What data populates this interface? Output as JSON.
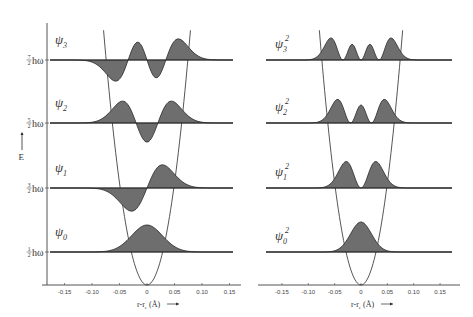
{
  "figure": {
    "left_panel": {
      "title": "Harmonic oscillator wavefunctions",
      "y_axis_label": "E",
      "energy_levels": [
        {
          "n": 0,
          "label": "½ hω",
          "num": "1",
          "den": "2",
          "wf_label": "ψ0"
        },
        {
          "n": 1,
          "label": "3/2 hω",
          "num": "3",
          "den": "2",
          "wf_label": "ψ1"
        },
        {
          "n": 2,
          "label": "5/2 hω",
          "num": "5",
          "den": "2",
          "wf_label": "ψ2"
        },
        {
          "n": 3,
          "label": "7/2 hω",
          "num": "7",
          "den": "2",
          "wf_label": "ψ3"
        }
      ],
      "x_axis_label": "r-re (Å) →",
      "x_ticks": [
        "-0.15",
        "-0.10",
        "-0.05",
        "0",
        "0.05",
        "0.10",
        "0.15"
      ]
    },
    "right_panel": {
      "title": "Probability densities",
      "levels": [
        {
          "n": 0,
          "wf_label": "ψ0",
          "sup": "2"
        },
        {
          "n": 1,
          "wf_label": "ψ1",
          "sup": "2"
        },
        {
          "n": 2,
          "wf_label": "ψ2",
          "sup": "2"
        },
        {
          "n": 3,
          "wf_label": "ψ3",
          "sup": "2"
        }
      ],
      "x_axis_label": "r-re (Å) →",
      "x_ticks": [
        "-0.15",
        "-0.10",
        "-0.05",
        "0",
        "0.05",
        "0.10",
        "0.15"
      ]
    },
    "colors": {
      "fill": "#6e6e6e",
      "line": "#2a2a2a",
      "axis": "#555555"
    }
  },
  "labels": {
    "psi": "ψ",
    "h_omega": "hω",
    "E": "E",
    "x_axis": "r-r",
    "x_sub": "e",
    "x_unit": "(Å)"
  }
}
